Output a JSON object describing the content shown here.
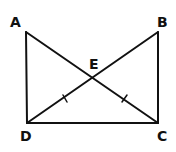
{
  "diagram": {
    "type": "geometry",
    "points": {
      "A": {
        "label": "A",
        "x": 26,
        "y": 32
      },
      "B": {
        "label": "B",
        "x": 158,
        "y": 32
      },
      "C": {
        "label": "C",
        "x": 158,
        "y": 123
      },
      "D": {
        "label": "D",
        "x": 27,
        "y": 123
      },
      "E": {
        "label": "E",
        "x": 93,
        "y": 78
      }
    },
    "segments": [
      "AD",
      "BC",
      "DC",
      "AC",
      "DB"
    ],
    "tick_marks": [
      "DE",
      "EC"
    ],
    "stroke_color": "#111111"
  }
}
